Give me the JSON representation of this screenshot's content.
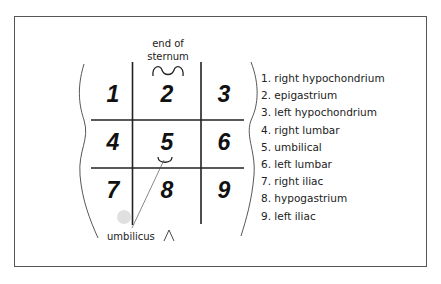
{
  "diagram": {
    "annotations": {
      "sternum_label_line1": "end of",
      "sternum_label_line2": "sternum",
      "umbilicus_label": "umbilicus"
    },
    "regions": [
      {
        "number": "1",
        "name": "right hypochondrium"
      },
      {
        "number": "2",
        "name": "epigastrium"
      },
      {
        "number": "3",
        "name": "left hypochondrium"
      },
      {
        "number": "4",
        "name": "right lumbar"
      },
      {
        "number": "5",
        "name": "umbilical"
      },
      {
        "number": "6",
        "name": "left lumbar"
      },
      {
        "number": "7",
        "name": "right iliac"
      },
      {
        "number": "8",
        "name": "hypogastrium"
      },
      {
        "number": "9",
        "name": "left iliac"
      }
    ],
    "legend": [
      "1. right hypochondrium",
      "2. epigastrium",
      "3. left hypochondrium",
      "4. right lumbar",
      "5. umbilical",
      "6. left lumbar",
      "7. right iliac",
      "8. hypogastrium",
      "9. left iliac"
    ],
    "colors": {
      "line": "#222222",
      "frame": "#555555",
      "background": "#ffffff"
    }
  }
}
